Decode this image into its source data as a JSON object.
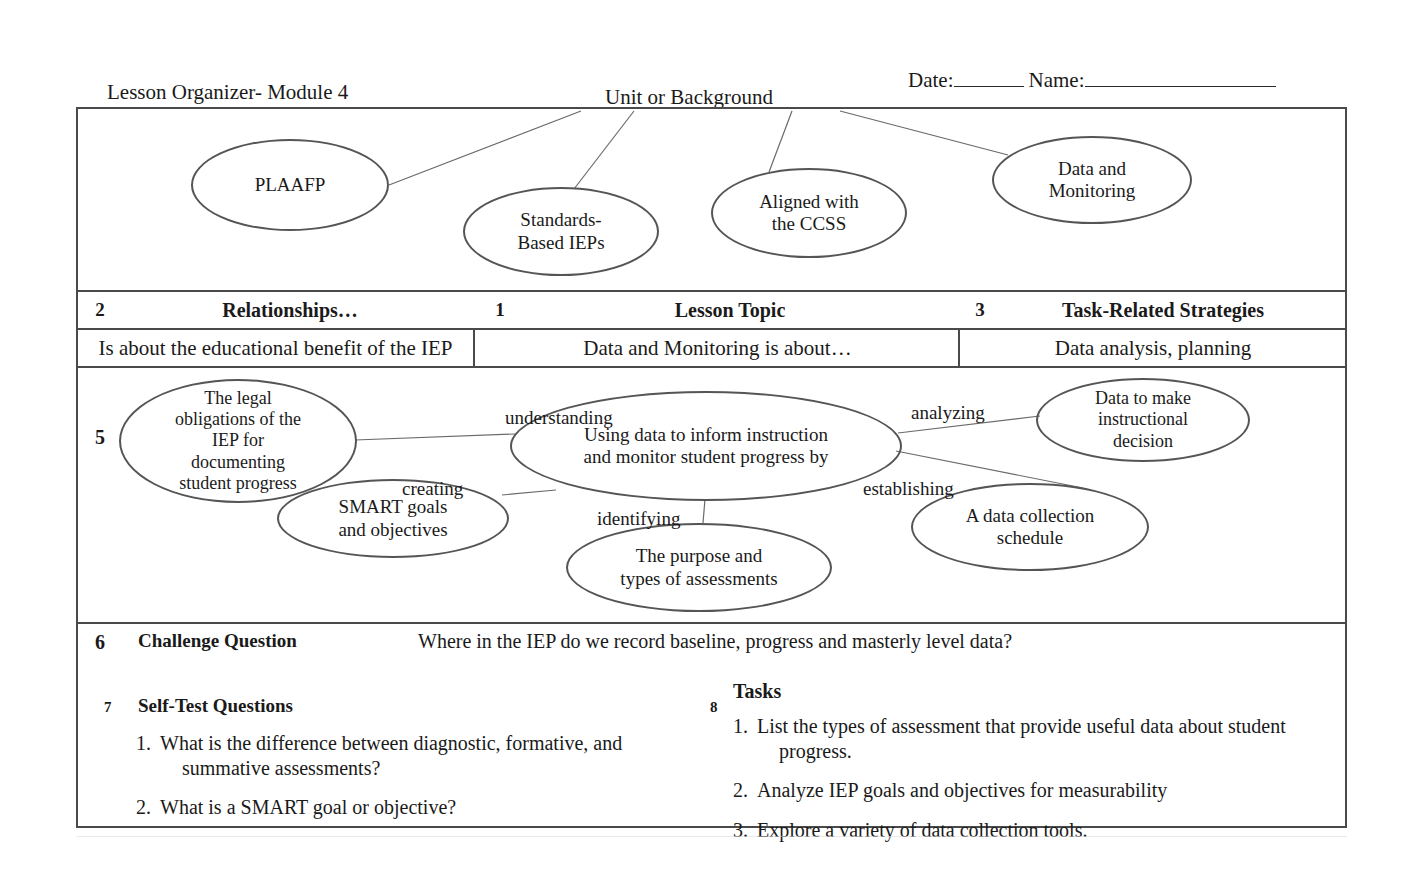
{
  "header": {
    "unit_label_line1": "Unit or Background",
    "unit_label_line2": "The Blueprint Modules",
    "organizer_title": "Lesson Organizer- Module 4",
    "date_label": "Date:",
    "name_label": "Name:"
  },
  "background_ellipses": [
    {
      "id": "plaafp",
      "label": "PLAAFP"
    },
    {
      "id": "standards",
      "label": "Standards-\nBased IEPs"
    },
    {
      "id": "ccss",
      "label": "Aligned with\nthe CCSS"
    },
    {
      "id": "datamon",
      "label": "Data and\nMonitoring"
    }
  ],
  "columns": {
    "relationships": {
      "number": "2",
      "title": "Relationships…",
      "subtitle": "Is about the educational benefit of the IEP"
    },
    "lesson_topic": {
      "number": "1",
      "title": "Lesson Topic",
      "subtitle": "Data and Monitoring is about…"
    },
    "task_related": {
      "number": "3",
      "title": "Task-Related Strategies",
      "subtitle": "Data analysis, planning"
    }
  },
  "map": {
    "number": "5",
    "center": "Using data to inform instruction\nand monitor student progress by",
    "nodes": [
      {
        "id": "legal",
        "label": "The legal\nobligations of the\nIEP for\ndocumenting\nstudent progress"
      },
      {
        "id": "smart",
        "label": "SMART goals\nand objectives"
      },
      {
        "id": "purpose",
        "label": "The purpose and\ntypes of assessments"
      },
      {
        "id": "decision",
        "label": "Data to make\ninstructional\ndecision"
      },
      {
        "id": "schedule",
        "label": "A data collection\nschedule"
      }
    ],
    "edge_labels": {
      "understanding": "understanding",
      "creating": "creating",
      "identifying": "identifying",
      "analyzing": "analyzing",
      "establishing": "establishing"
    }
  },
  "challenge": {
    "number": "6",
    "title": "Challenge Question",
    "text": "Where in the IEP do we record baseline, progress and masterly level data?"
  },
  "self_test": {
    "number": "7",
    "title": "Self-Test Questions",
    "items": [
      {
        "num": "1.",
        "line1": "What is the difference between diagnostic, formative, and",
        "line2": "summative assessments?"
      },
      {
        "num": "2.",
        "line1": "What is a SMART goal or objective?",
        "line2": ""
      }
    ]
  },
  "tasks": {
    "number": "8",
    "title": "Tasks",
    "items": [
      {
        "num": "1.",
        "line1": "List the types of assessment that provide useful data about student",
        "line2": "progress."
      },
      {
        "num": "2.",
        "line1": "Analyze IEP goals and objectives for measurability",
        "line2": ""
      },
      {
        "num": "3.",
        "line1": "Explore a variety of data collection tools.",
        "line2": ""
      }
    ]
  },
  "colors": {
    "ink": "#1a1a1a",
    "rule": "#4a4a4a",
    "ellipse_stroke": "#555555",
    "wire": "#6a6a6a"
  }
}
